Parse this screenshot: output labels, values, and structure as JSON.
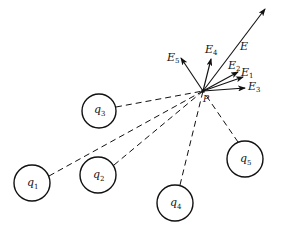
{
  "diagram": {
    "point": {
      "name": "P",
      "x": 203,
      "y": 91
    },
    "charges": [
      {
        "label": "q",
        "sub": "1",
        "cx": 32,
        "cy": 183,
        "r": 18
      },
      {
        "label": "q",
        "sub": "2",
        "cx": 98,
        "cy": 175,
        "r": 18
      },
      {
        "label": "q",
        "sub": "3",
        "cx": 99,
        "cy": 111,
        "r": 17
      },
      {
        "label": "q",
        "sub": "4",
        "cx": 175,
        "cy": 203,
        "r": 18
      },
      {
        "label": "q",
        "sub": "5",
        "cx": 245,
        "cy": 159,
        "r": 18
      }
    ],
    "vectors": [
      {
        "label": "E",
        "sub": "",
        "x2": 265,
        "y2": 9
      },
      {
        "label": "E",
        "sub": "1",
        "x2": 243,
        "y2": 77
      },
      {
        "label": "E",
        "sub": "2",
        "x2": 238,
        "y2": 72
      },
      {
        "label": "E",
        "sub": "3",
        "x2": 245,
        "y2": 88
      },
      {
        "label": "E",
        "sub": "4",
        "x2": 211,
        "y2": 59
      },
      {
        "label": "E",
        "sub": "5",
        "x2": 181,
        "y2": 58
      }
    ],
    "labels": {
      "P": "P",
      "q1": "q",
      "q1_sub": "1",
      "q2": "q",
      "q2_sub": "2",
      "q3": "q",
      "q3_sub": "3",
      "q4": "q",
      "q4_sub": "4",
      "q5": "q",
      "q5_sub": "5",
      "E": "E",
      "E1": "E",
      "E1_sub": "1",
      "E2": "E",
      "E2_sub": "2",
      "E3": "E",
      "E3_sub": "3",
      "E4": "E",
      "E4_sub": "4",
      "E5": "E",
      "E5_sub": "5"
    },
    "colors": {
      "stroke": "#111111",
      "background": "#ffffff"
    }
  }
}
